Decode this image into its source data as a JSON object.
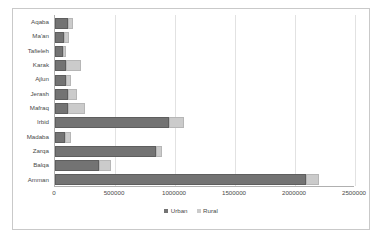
{
  "chart_data": {
    "type": "bar",
    "orientation": "horizontal",
    "stacked": true,
    "title": "",
    "xlabel": "",
    "ylabel": "",
    "xlim": [
      0,
      2500000
    ],
    "xticks": [
      "0",
      "500000",
      "1000000",
      "1500000",
      "2000000",
      "2500000"
    ],
    "xtick_values": [
      0,
      500000,
      1000000,
      1500000,
      2000000,
      2500000
    ],
    "grid": true,
    "legend_position": "bottom",
    "categories": [
      "Amman",
      "Balqa",
      "Zarqa",
      "Madaba",
      "Irbid",
      "Mafraq",
      "Jerash",
      "Ajlun",
      "Karak",
      "Tafieleh",
      "Ma'an",
      "Aqaba"
    ],
    "series": [
      {
        "name": "Urban",
        "color": "#737373",
        "values": [
          2075000,
          350000,
          825000,
          70000,
          930000,
          95000,
          95000,
          75000,
          75000,
          50000,
          55000,
          90000
        ]
      },
      {
        "name": "Rural",
        "color": "#cbcbcb",
        "values": [
          90000,
          85000,
          35000,
          30000,
          110000,
          120000,
          55000,
          25000,
          105000,
          10000,
          30000,
          25000
        ]
      }
    ]
  },
  "legend": {
    "items": [
      {
        "label": "Urban",
        "swatch": "urban-swatch"
      },
      {
        "label": "Rural",
        "swatch": "rural-swatch"
      }
    ]
  }
}
